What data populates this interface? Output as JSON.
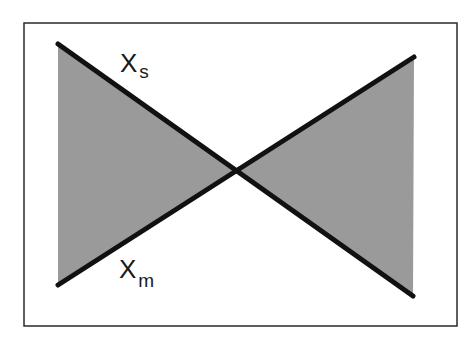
{
  "diagram": {
    "type": "bowtie-crossing-lines",
    "frame": {
      "x": 24,
      "y": 23,
      "width": 433,
      "height": 303,
      "stroke": "#2a2a2a"
    },
    "fill_color": "#9a9a9a",
    "line_color": "#111111",
    "intersection": {
      "x": 236,
      "y": 171
    },
    "lines": [
      {
        "name": "Xs",
        "x1": 58,
        "y1": 44,
        "x2": 413,
        "y2": 296
      },
      {
        "name": "Xm",
        "x1": 58,
        "y1": 285,
        "x2": 414,
        "y2": 57
      }
    ],
    "labels": {
      "xs": {
        "main": "X",
        "sub": "s"
      },
      "xm": {
        "main": "X",
        "sub": "m"
      }
    }
  }
}
